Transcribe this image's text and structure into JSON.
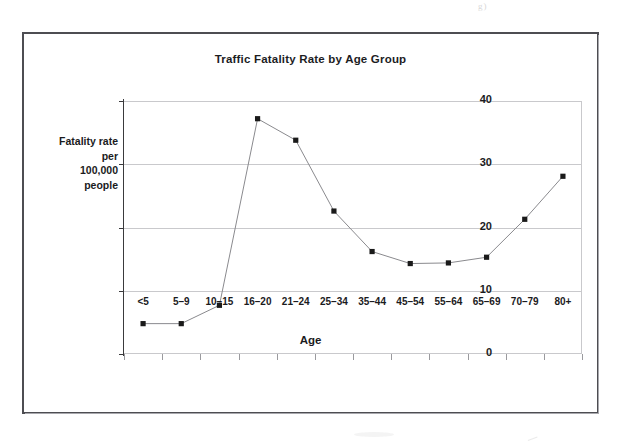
{
  "figure": {
    "frame_color": "#4d4d52",
    "background": "#ffffff"
  },
  "chart_data": {
    "type": "line",
    "title": "Traffic Fatality Rate by Age Group",
    "xlabel": "Age",
    "ylabel": "Fatality rate per 100,000 people",
    "ylabel_lines": [
      "Fatality rate",
      "per",
      "100,000",
      "people"
    ],
    "categories": [
      "<5",
      "5–9",
      "10–15",
      "16–20",
      "21–24",
      "25–34",
      "35–44",
      "45–54",
      "55–64",
      "65–69",
      "70–79",
      "80+"
    ],
    "values": [
      4.8,
      4.8,
      7.7,
      37.2,
      33.8,
      22.6,
      16.2,
      14.3,
      14.4,
      15.3,
      21.3,
      28.1
    ],
    "ylim": [
      0,
      40
    ],
    "yticks": [
      0,
      10,
      20,
      30,
      40
    ],
    "ytick_labels": [
      "0",
      "10",
      "20",
      "30",
      "40"
    ],
    "grid": "horizontal",
    "legend": "none",
    "marker": "square",
    "marker_color": "#1a1a1a",
    "line_color": "#8a8a8e",
    "grid_color": "#c9c9cc"
  },
  "artifacts": {
    "scan_mark_top_right": "g)"
  }
}
